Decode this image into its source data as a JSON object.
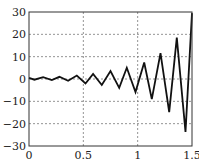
{
  "chart_data": {
    "type": "line",
    "title": "",
    "xlabel": "",
    "ylabel": "",
    "xlim": [
      0,
      1.5
    ],
    "ylim": [
      -30,
      30
    ],
    "grid": true,
    "legend": null,
    "xticks": [
      0,
      0.5,
      1,
      1.5
    ],
    "xtick_labels": [
      "0",
      "0.5",
      "1",
      "1.5"
    ],
    "yticks": [
      30,
      20,
      10,
      0,
      -10,
      -20,
      -30
    ],
    "ytick_labels": [
      "30",
      "20",
      "10",
      "0",
      "−10",
      "−20",
      "−30"
    ],
    "series": [
      {
        "name": "signal",
        "color": "#111111",
        "x": [
          0,
          0.05,
          0.13,
          0.21,
          0.28,
          0.36,
          0.44,
          0.52,
          0.59,
          0.67,
          0.75,
          0.83,
          0.9,
          0.98,
          1.06,
          1.13,
          1.21,
          1.29,
          1.36,
          1.44,
          1.5
        ],
        "y": [
          0.5,
          -0.3,
          0.8,
          -0.5,
          1.0,
          -0.8,
          1.5,
          -2.0,
          2.3,
          -2.7,
          3.6,
          -4.0,
          5.0,
          -5.8,
          7.4,
          -9.0,
          11.6,
          -14.8,
          18.5,
          -23.7,
          29.5
        ]
      }
    ]
  }
}
